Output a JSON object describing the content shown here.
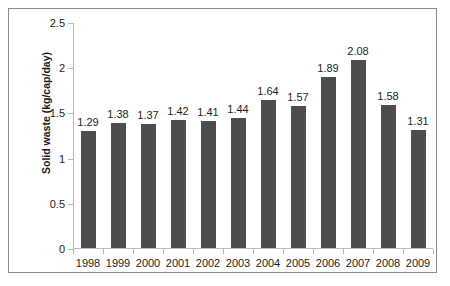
{
  "chart_data": {
    "type": "bar",
    "title": "",
    "xlabel": "",
    "ylabel": "Solid waste (kg/cap/day)",
    "categories": [
      "1998",
      "1999",
      "2000",
      "2001",
      "2002",
      "2003",
      "2004",
      "2005",
      "2006",
      "2007",
      "2008",
      "2009"
    ],
    "values": [
      1.29,
      1.38,
      1.37,
      1.42,
      1.41,
      1.44,
      1.64,
      1.57,
      1.89,
      2.08,
      1.58,
      1.31
    ],
    "data_labels": [
      "1.29",
      "1.38",
      "1.37",
      "1.42",
      "1.41",
      "1.44",
      "1.64",
      "1.57",
      "1.89",
      "2.08",
      "1.58",
      "1.31"
    ],
    "ylim": [
      0,
      2.5
    ],
    "y_ticks": [
      0,
      0.5,
      1,
      1.5,
      2,
      2.5
    ],
    "y_tick_labels": [
      "0",
      "0.5",
      "1",
      "1.5",
      "2",
      "2.5"
    ],
    "grid": false,
    "legend": false,
    "legend_position": "none",
    "series_color": "#4d4d4d",
    "axis_color": "#b9b9b9",
    "text_color": "#1c1c1c",
    "frame_color": "#8a8a8a"
  }
}
